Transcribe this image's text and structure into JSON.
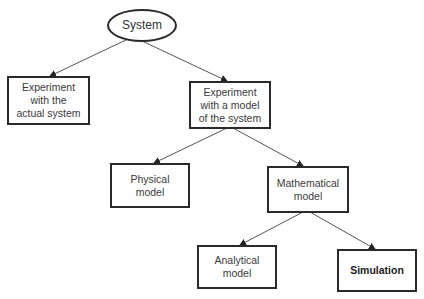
{
  "diagram": {
    "nodes": {
      "root": {
        "label": "System"
      },
      "actual": {
        "label": "Experiment\nwith the\nactual system"
      },
      "model": {
        "label": "Experiment\nwith a model\nof the system"
      },
      "physical": {
        "label": "Physical\nmodel"
      },
      "mathematical": {
        "label": "Mathematical\nmodel"
      },
      "analytical": {
        "label": "Analytical\nmodel"
      },
      "simulation": {
        "label": "Simulation"
      }
    },
    "edges": [
      [
        "root",
        "actual"
      ],
      [
        "root",
        "model"
      ],
      [
        "model",
        "physical"
      ],
      [
        "model",
        "mathematical"
      ],
      [
        "mathematical",
        "analytical"
      ],
      [
        "mathematical",
        "simulation"
      ]
    ],
    "colors": {
      "stroke": "#2a2a2a",
      "line": "#555555",
      "background": "#ffffff"
    }
  }
}
